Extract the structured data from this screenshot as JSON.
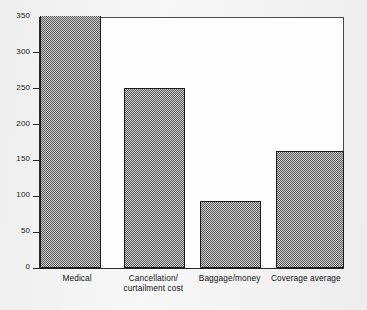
{
  "chart_data": {
    "type": "bar",
    "title": "",
    "subtitle": "",
    "xlabel": "",
    "ylabel": "",
    "categories": [
      "Medical",
      "Cancellation/\ncurtailment cost",
      "Baggage/money",
      "Coverage average"
    ],
    "values": [
      350,
      250,
      92,
      162
    ],
    "ylim": [
      0,
      350
    ],
    "ytick_labels": [
      "0",
      "50",
      "100",
      "150",
      "200",
      "250",
      "300",
      "350"
    ],
    "ytick_values": [
      0,
      50,
      100,
      150,
      200,
      250,
      300,
      350
    ],
    "grid": false,
    "legend": null,
    "legend_position": "none",
    "bar_fill": "#8d8d8d",
    "bar_edge": "#1c1c1c",
    "plot_background": "#fdfdfd",
    "page_background": "#efefef"
  }
}
